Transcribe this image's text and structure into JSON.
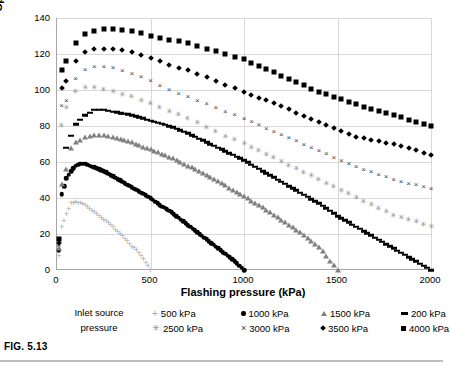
{
  "caption": "FIG. 5.13",
  "chart_data": {
    "type": "scatter",
    "title": "",
    "xlabel": "Flashing pressure (kPa)",
    "ylabel": "Specific turbine power output (kJ/kg)",
    "xlim": [
      0,
      2000
    ],
    "ylim": [
      0,
      140
    ],
    "xticks": [
      0,
      500,
      1000,
      1500,
      2000
    ],
    "yticks": [
      0,
      20,
      40,
      60,
      80,
      100,
      120,
      140
    ],
    "grid": true,
    "legend_position": "bottom",
    "legend_title": "Inlet source pressure",
    "series": [
      {
        "name": "500 kPa",
        "marker": "plus",
        "color": "#a6a6a6",
        "x": [
          10,
          25,
          50,
          75,
          100,
          125,
          150,
          175,
          200,
          225,
          250,
          275,
          300,
          325,
          350,
          375,
          400,
          425,
          450,
          475,
          500
        ],
        "y": [
          8,
          24,
          31,
          37,
          38,
          37,
          36,
          34,
          32,
          30,
          28,
          26,
          24,
          21,
          19,
          16,
          13,
          11,
          8,
          4,
          0
        ]
      },
      {
        "name": "1000 kPa",
        "marker": "circle",
        "color": "#000000",
        "x": [
          10,
          25,
          50,
          75,
          100,
          125,
          150,
          200,
          250,
          300,
          350,
          400,
          450,
          500,
          550,
          600,
          650,
          700,
          750,
          800,
          850,
          900,
          950,
          1000
        ],
        "y": [
          11,
          42,
          51,
          55,
          58,
          59,
          59,
          57,
          55,
          52,
          49,
          46,
          43,
          40,
          36,
          33,
          29,
          25,
          21,
          17,
          13,
          9,
          5,
          0
        ]
      },
      {
        "name": "1500 kPa",
        "marker": "triangle",
        "color": "#808080",
        "x": [
          10,
          25,
          50,
          75,
          100,
          150,
          200,
          250,
          300,
          400,
          500,
          600,
          700,
          800,
          900,
          1000,
          1100,
          1200,
          1300,
          1400,
          1500
        ],
        "y": [
          12,
          48,
          56,
          68,
          71,
          74,
          75,
          75,
          74,
          71,
          67,
          63,
          58,
          53,
          47,
          41,
          35,
          28,
          21,
          13,
          0
        ]
      },
      {
        "name": "2500 kPa",
        "marker": "star",
        "color": "#8c8c8c",
        "x": [
          10,
          25,
          50,
          100,
          150,
          200,
          250,
          300,
          400,
          500,
          600,
          700,
          800,
          900,
          1000,
          1200,
          1400,
          1600,
          1800,
          2000
        ],
        "y": [
          13,
          80,
          90,
          99,
          101,
          101,
          100,
          99,
          96,
          92,
          88,
          84,
          79,
          74,
          70,
          60,
          50,
          40,
          30,
          24
        ]
      },
      {
        "name": "3000 kPa",
        "marker": "x",
        "color": "#404040",
        "x": [
          10,
          25,
          50,
          100,
          150,
          200,
          250,
          300,
          400,
          500,
          600,
          700,
          800,
          900,
          1000,
          1200,
          1400,
          1600,
          1800,
          2000
        ],
        "y": [
          14,
          91,
          94,
          106,
          111,
          113,
          113,
          112,
          109,
          105,
          100,
          96,
          92,
          88,
          84,
          75,
          66,
          57,
          50,
          45
        ]
      },
      {
        "name": "3500 kPa",
        "marker": "diamond",
        "color": "#000000",
        "x": [
          10,
          25,
          50,
          100,
          150,
          200,
          250,
          300,
          400,
          500,
          600,
          700,
          800,
          900,
          1000,
          1200,
          1400,
          1600,
          1800,
          2000
        ],
        "y": [
          15,
          101,
          105,
          116,
          121,
          123,
          123,
          123,
          121,
          118,
          114,
          111,
          107,
          103,
          99,
          91,
          82,
          74,
          70,
          64
        ]
      },
      {
        "name": "4000 kPa",
        "marker": "square",
        "color": "#000000",
        "x": [
          10,
          25,
          50,
          100,
          150,
          200,
          250,
          300,
          400,
          500,
          600,
          700,
          800,
          900,
          1000,
          1200,
          1400,
          1600,
          1800,
          2000
        ],
        "y": [
          17,
          111,
          116,
          126,
          131,
          133,
          134,
          134,
          133,
          130,
          128,
          126,
          123,
          120,
          117,
          108,
          99,
          92,
          86,
          80
        ]
      },
      {
        "name": "200 kPa",
        "marker": "dash",
        "color": "#000000",
        "x": [
          50,
          100,
          150,
          200,
          250,
          300,
          400,
          500,
          600,
          700,
          800,
          900,
          1000,
          1100,
          1200,
          1300,
          1400,
          1500,
          1600,
          1700,
          1800,
          1900,
          2000
        ],
        "y": [
          68,
          81,
          86,
          89,
          89,
          88,
          86,
          83,
          80,
          76,
          71,
          66,
          61,
          55,
          49,
          43,
          37,
          30,
          24,
          18,
          12,
          6,
          0
        ]
      }
    ]
  },
  "legend": {
    "title_line1": "Inlet source",
    "title_line2": "pressure",
    "entries": [
      {
        "label": "500 kPa",
        "marker": "plus"
      },
      {
        "label": "1000 kPa",
        "marker": "circle"
      },
      {
        "label": "1500 kPa",
        "marker": "triangle"
      },
      {
        "label": "200 kPa",
        "marker": "dash"
      },
      {
        "label": "2500 kPa",
        "marker": "star"
      },
      {
        "label": "3000 kPa",
        "marker": "x"
      },
      {
        "label": "3500 kPa",
        "marker": "diamond"
      },
      {
        "label": "4000 kPa",
        "marker": "square"
      }
    ]
  }
}
